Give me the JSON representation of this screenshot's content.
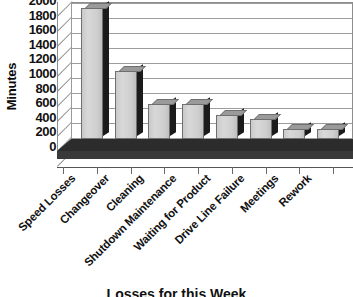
{
  "chart_data": {
    "type": "bar",
    "title": "Losses for this Week",
    "title_clipped": true,
    "xlabel": "",
    "ylabel": "Minutes",
    "ylim": [
      0,
      2000
    ],
    "ytick_step": 200,
    "yticks": [
      2000,
      1800,
      1600,
      1400,
      1200,
      1000,
      800,
      600,
      400,
      200,
      0
    ],
    "grid": true,
    "grid_axis": "y",
    "legend": "none",
    "three_d": true,
    "categories": [
      "Speed Losses",
      "Changeover",
      "Cleaning",
      "Shutdown Maintenance",
      "Waiting for Product",
      "Drive Line Failure",
      "Meetings",
      "Rework"
    ],
    "values": [
      2000,
      1040,
      540,
      540,
      370,
      300,
      150,
      150
    ],
    "series": [
      {
        "name": "Minutes",
        "values": [
          2000,
          1040,
          540,
          540,
          370,
          300,
          150,
          150
        ]
      }
    ],
    "colors": {
      "bar_face": "#d0d0d0",
      "bar_side": "#1b1b1b",
      "bar_top": "#9a9a9a",
      "bar_outline": "#6f6f6f",
      "floor": "#2a2a2a",
      "gridline": "#9d9d9d",
      "wall": "#ffffff",
      "text": "#111111"
    }
  }
}
